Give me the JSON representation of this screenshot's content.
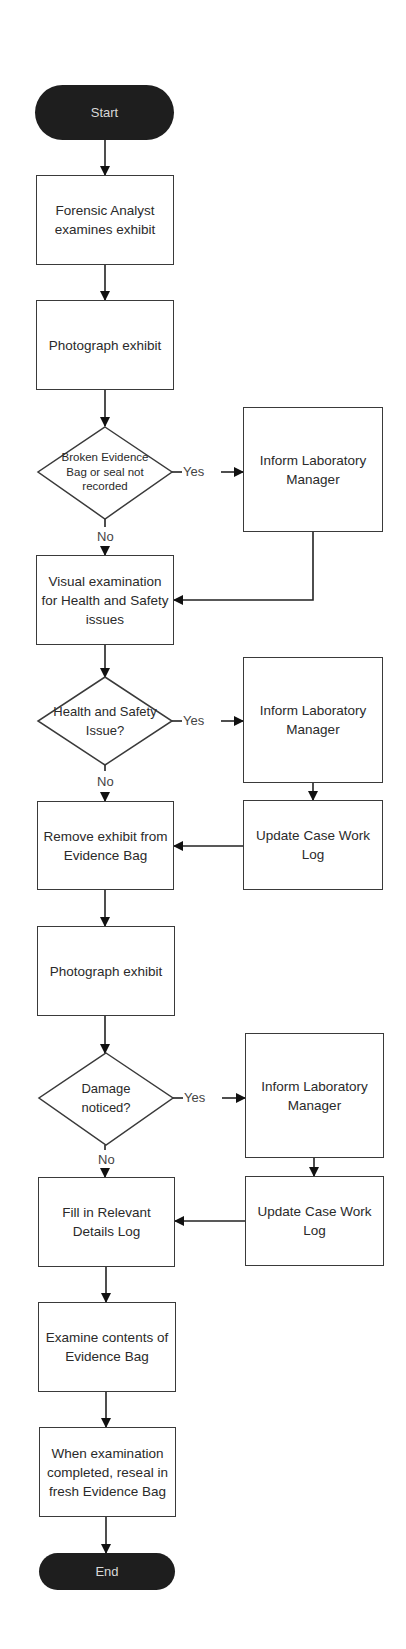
{
  "diagram": {
    "type": "flowchart",
    "terminals": {
      "start": "Start",
      "end": "End"
    },
    "process": [
      {
        "id": "p1",
        "label": "Forensic Analyst examines exhibit"
      },
      {
        "id": "p2",
        "label": "Photograph exhibit"
      },
      {
        "id": "p3",
        "label": "Visual examination for Health and Safety issues"
      },
      {
        "id": "p4",
        "label": "Remove exhibit from Evidence Bag"
      },
      {
        "id": "p5",
        "label": "Photograph exhibit"
      },
      {
        "id": "p6",
        "label": "Fill in Relevant Details Log"
      },
      {
        "id": "p7",
        "label": "Examine contents of Evidence Bag"
      },
      {
        "id": "p8",
        "label": "When examination completed, reseal in fresh Evidence Bag"
      }
    ],
    "decisions": [
      {
        "id": "d1",
        "label": "Broken Evidence Bag or seal not recorded",
        "yes": "Yes",
        "no": "No"
      },
      {
        "id": "d2",
        "label": "Health and Safety Issue?",
        "yes": "Yes",
        "no": "No"
      },
      {
        "id": "d3",
        "label": "Damage noticed?",
        "yes": "Yes",
        "no": "No"
      }
    ],
    "side": [
      {
        "id": "s1",
        "label": "Inform Laboratory Manager"
      },
      {
        "id": "s2",
        "label": "Inform Laboratory Manager"
      },
      {
        "id": "s3",
        "label": "Update Case Work Log"
      },
      {
        "id": "s4",
        "label": "Inform Laboratory Manager"
      },
      {
        "id": "s5",
        "label": "Update Case Work Log"
      }
    ],
    "colors": {
      "terminal_fill": "#1e1e1e",
      "terminal_text": "#d8d8d8",
      "stroke": "#3a3a3a",
      "background": "#ffffff"
    }
  }
}
